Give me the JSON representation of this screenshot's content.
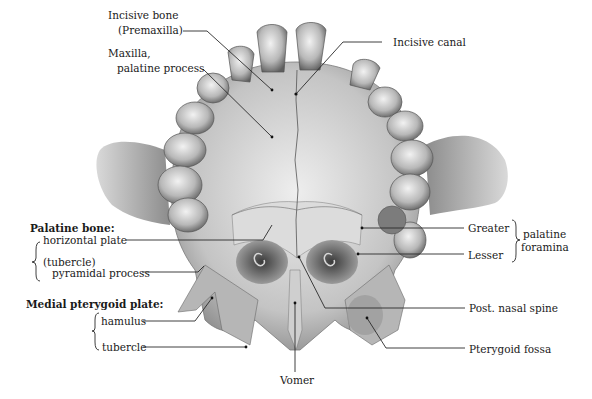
{
  "figure": {
    "colors": {
      "background": "#ffffff",
      "bone_light": "#e6e6e6",
      "bone_mid": "#b5b5b5",
      "bone_dark": "#6e6e6e",
      "text": "#1a1a1a",
      "leader": "#2a2a2a"
    }
  },
  "labels": {
    "incisive_bone_line1": "Incisive bone",
    "incisive_bone_line2": "(Premaxilla)",
    "maxilla_line1": "Maxilla,",
    "maxilla_line2": "palatine process",
    "incisive_canal": "Incisive canal",
    "palatine_bone": "Palatine bone:",
    "horizontal_plate": "horizontal plate",
    "tubercle_paren": "(tubercle)",
    "pyramidal_process": "pyramidal process",
    "medial_pterygoid_plate": "Medial pterygoid plate:",
    "hamulus": "hamulus",
    "tubercle": "tubercle",
    "vomer": "Vomer",
    "greater": "Greater",
    "lesser": "Lesser",
    "palatine": "palatine",
    "foramina": "foramina",
    "post_nasal_spine": "Post. nasal spine",
    "pterygoid_fossa": "Pterygoid fossa"
  }
}
